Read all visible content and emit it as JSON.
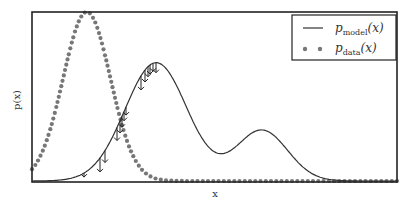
{
  "chart_data": {
    "type": "line",
    "title": "",
    "xlabel": "x",
    "ylabel": "p(x)",
    "grid": false,
    "legend_position": "upper right",
    "legend": [
      {
        "label": "p_model(x)",
        "style": "solid line",
        "color": "#333333"
      },
      {
        "label": "p_data(x)",
        "style": "dotted markers",
        "color": "#777777"
      }
    ],
    "series": [
      {
        "name": "p_model(x)",
        "kind": "mixture of two gaussians",
        "components": [
          {
            "center_frac": 0.34,
            "height_frac": 0.7,
            "width_frac": 0.085
          },
          {
            "center_frac": 0.63,
            "height_frac": 0.3,
            "width_frac": 0.07
          }
        ]
      },
      {
        "name": "p_data(x)",
        "kind": "gaussian",
        "components": [
          {
            "center_frac": 0.15,
            "height_frac": 1.0,
            "width_frac": 0.065
          }
        ]
      }
    ],
    "annotations": "Downward arrows on the rising flank of p_model(x) indicating density being pushed down toward p_data(x)",
    "xticks": [],
    "yticks": []
  },
  "labels": {
    "xlabel": "x",
    "ylabel": "p(x)",
    "legend_model_main": "p",
    "legend_model_sub": "model",
    "legend_data_main": "p",
    "legend_data_sub": "data",
    "legend_arg": "(x)"
  },
  "colors": {
    "model": "#333333",
    "data": "#777777",
    "axes": "#222222"
  }
}
